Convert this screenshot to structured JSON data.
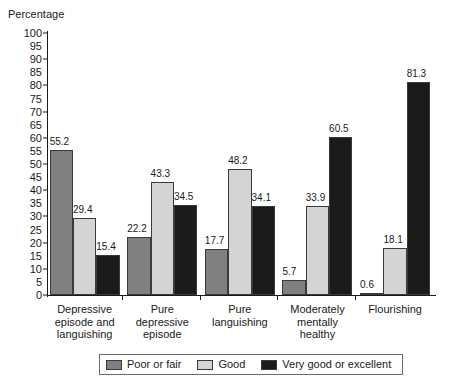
{
  "chart_data": {
    "type": "bar",
    "title": "",
    "ylabel": "Percentage",
    "xlabel": "",
    "ylim": [
      0,
      100
    ],
    "ytick_step": 5,
    "yticks": [
      0,
      5,
      10,
      15,
      20,
      25,
      30,
      35,
      40,
      45,
      50,
      55,
      60,
      65,
      70,
      75,
      80,
      85,
      90,
      95,
      100
    ],
    "grid": false,
    "legend_position": "bottom",
    "categories": [
      "Depressive\nepisode and\nlanguishing",
      "Pure\ndepressive\nepisode",
      "Pure\nlanguishing",
      "Moderately\nmentally\nhealthy",
      "Flourishing"
    ],
    "series": [
      {
        "name": "Poor or fair",
        "color": "#808080",
        "values": [
          55.2,
          22.2,
          17.7,
          5.7,
          0.6
        ]
      },
      {
        "name": "Good",
        "color": "#d4d4d4",
        "values": [
          29.4,
          43.3,
          48.2,
          33.9,
          18.1
        ]
      },
      {
        "name": "Very good or excellent",
        "color": "#1a1a1a",
        "values": [
          15.4,
          34.5,
          34.1,
          60.5,
          81.3
        ]
      }
    ]
  }
}
